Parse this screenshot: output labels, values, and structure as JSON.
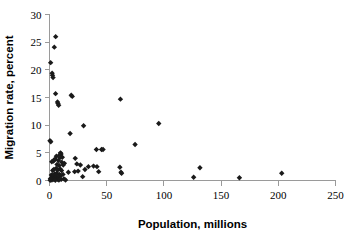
{
  "chart_data": {
    "type": "scatter",
    "title": "",
    "xlabel": "Population, millions",
    "ylabel": "Migration rate, percent",
    "xlim": [
      0,
      250
    ],
    "ylim": [
      0,
      30
    ],
    "xticks": [
      0,
      50,
      100,
      150,
      200,
      250
    ],
    "yticks": [
      0,
      5,
      10,
      15,
      20,
      25,
      30
    ],
    "grid": false,
    "legend": null,
    "marker": "diamond",
    "marker_color": "#1a1a1a",
    "series": [
      {
        "name": "countries",
        "points": [
          [
            5.4,
            26.0
          ],
          [
            4.2,
            24.1
          ],
          [
            1.0,
            21.3
          ],
          [
            2.3,
            19.4
          ],
          [
            2.6,
            19.0
          ],
          [
            3.1,
            18.6
          ],
          [
            5.3,
            15.7
          ],
          [
            19.0,
            15.4
          ],
          [
            19.9,
            15.2
          ],
          [
            62.0,
            14.7
          ],
          [
            7.0,
            14.2
          ],
          [
            7.4,
            13.9
          ],
          [
            8.0,
            13.6
          ],
          [
            95.5,
            10.3
          ],
          [
            29.8,
            9.9
          ],
          [
            18.0,
            8.5
          ],
          [
            0.4,
            7.2
          ],
          [
            1.1,
            7.0
          ],
          [
            74.8,
            6.5
          ],
          [
            41.0,
            5.6
          ],
          [
            45.5,
            5.6
          ],
          [
            46.8,
            5.6
          ],
          [
            9.6,
            5.0
          ],
          [
            10.1,
            4.8
          ],
          [
            8.8,
            4.6
          ],
          [
            6.0,
            4.4
          ],
          [
            11.2,
            4.2
          ],
          [
            9.0,
            4.1
          ],
          [
            22.5,
            4.0
          ],
          [
            5.0,
            3.9
          ],
          [
            4.0,
            3.7
          ],
          [
            7.8,
            3.6
          ],
          [
            3.4,
            3.5
          ],
          [
            2.0,
            3.4
          ],
          [
            10.8,
            3.3
          ],
          [
            13.0,
            3.1
          ],
          [
            23.9,
            3.0
          ],
          [
            6.6,
            2.9
          ],
          [
            12.0,
            2.8
          ],
          [
            8.4,
            2.7
          ],
          [
            38.5,
            2.6
          ],
          [
            34.0,
            2.5
          ],
          [
            61.5,
            2.4
          ],
          [
            131.5,
            2.3
          ],
          [
            5.8,
            2.2
          ],
          [
            9.3,
            2.1
          ],
          [
            3.8,
            2.0
          ],
          [
            31.0,
            2.0
          ],
          [
            7.2,
            1.9
          ],
          [
            2.8,
            1.8
          ],
          [
            10.5,
            1.8
          ],
          [
            25.0,
            1.7
          ],
          [
            22.0,
            1.6
          ],
          [
            62.5,
            1.5
          ],
          [
            63.0,
            1.3
          ],
          [
            203.0,
            1.3
          ],
          [
            6.3,
            1.3
          ],
          [
            4.6,
            1.2
          ],
          [
            8.6,
            1.1
          ],
          [
            11.8,
            1.1
          ],
          [
            1.6,
            1.0
          ],
          [
            3.0,
            0.9
          ],
          [
            9.9,
            0.9
          ],
          [
            5.6,
            0.8
          ],
          [
            29.0,
            0.7
          ],
          [
            2.4,
            0.6
          ],
          [
            7.6,
            0.6
          ],
          [
            126.0,
            0.6
          ],
          [
            166.0,
            0.5
          ],
          [
            1.3,
            0.4
          ],
          [
            4.8,
            0.4
          ],
          [
            12.6,
            0.3
          ],
          [
            0.8,
            0.3
          ],
          [
            6.9,
            0.2
          ],
          [
            3.6,
            0.2
          ],
          [
            10.2,
            0.2
          ],
          [
            2.1,
            0.1
          ],
          [
            8.2,
            0.1
          ],
          [
            0.6,
            0.05
          ],
          [
            5.1,
            0.05
          ],
          [
            14.0,
            0.1
          ],
          [
            16.5,
            1.5
          ],
          [
            27.0,
            2.8
          ],
          [
            41.5,
            2.5
          ],
          [
            43.0,
            1.6
          ]
        ]
      }
    ]
  }
}
